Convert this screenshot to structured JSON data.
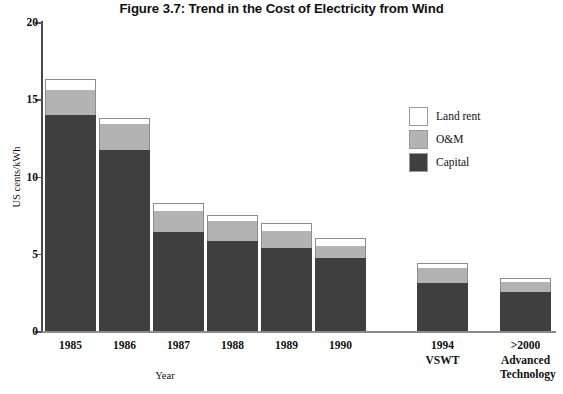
{
  "chart_data": {
    "type": "bar",
    "title": "Figure 3.7: Trend in the Cost of Electricity from Wind",
    "xlabel": "Year",
    "ylabel": "US cents/kWh",
    "ylim": [
      0,
      20
    ],
    "yticks": [
      0,
      5,
      10,
      15,
      20
    ],
    "ytick_labels": [
      "0",
      "5",
      "10",
      "15",
      "20"
    ],
    "grid": false,
    "stacked": true,
    "legend_position": "upper right inside",
    "categories": [
      "1985",
      "1986",
      "1987",
      "1988",
      "1989",
      "1990",
      "1994 VSWT",
      ">2000 Advanced Technology"
    ],
    "category_lines": [
      [
        "1985"
      ],
      [
        "1986"
      ],
      [
        "1987"
      ],
      [
        "1988"
      ],
      [
        "1989"
      ],
      [
        "1990"
      ],
      [
        "1994",
        "VSWT"
      ],
      [
        ">2000",
        "Advanced",
        "Technology"
      ]
    ],
    "series": [
      {
        "name": "Capital",
        "color": "#3f3f3f",
        "values": [
          14.0,
          11.7,
          6.4,
          5.8,
          5.4,
          4.7,
          3.1,
          2.5
        ]
      },
      {
        "name": "O&M",
        "color": "#b3b3b3",
        "values": [
          1.6,
          1.7,
          1.4,
          1.3,
          1.1,
          0.8,
          1.0,
          0.7
        ]
      },
      {
        "name": "Land rent",
        "color": "#ffffff",
        "values": [
          0.7,
          0.4,
          0.5,
          0.4,
          0.5,
          0.5,
          0.3,
          0.2
        ]
      }
    ],
    "totals": [
      16.3,
      13.8,
      8.3,
      7.5,
      7.0,
      6.0,
      4.4,
      3.4
    ]
  },
  "legend": {
    "items": [
      {
        "label": "Land rent",
        "color": "#ffffff"
      },
      {
        "label": "O&M",
        "color": "#b3b3b3"
      },
      {
        "label": "Capital",
        "color": "#3f3f3f"
      }
    ]
  }
}
